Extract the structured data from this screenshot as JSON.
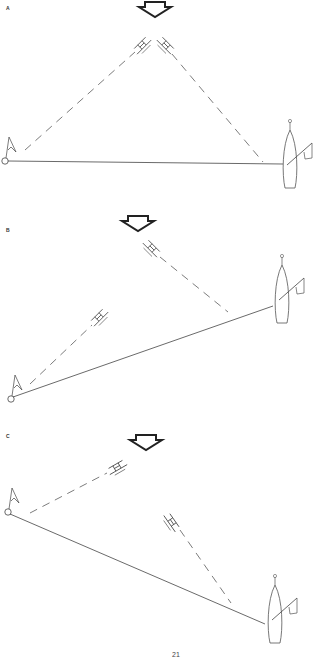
{
  "panels": [
    {
      "label": "A",
      "description": "Starting line square; both boats sail close-hauled to windward"
    },
    {
      "label": "B",
      "description": "Committee boat end favored"
    },
    {
      "label": "C",
      "description": "Pin end favored"
    }
  ],
  "page_number": "21",
  "colors": {
    "line": "#444444",
    "arrow": "#222222",
    "background": "#ffffff"
  },
  "icons": [
    "wind-arrow-icon",
    "sailboat-icon",
    "buoy-icon",
    "flag-icon",
    "committee-boat-icon"
  ]
}
